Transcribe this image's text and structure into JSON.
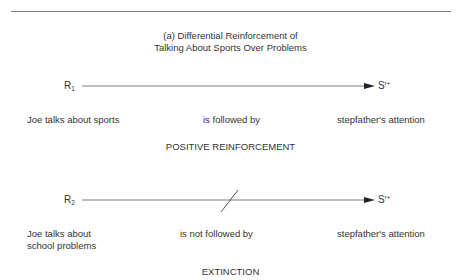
{
  "title": {
    "line1": "(a) Differential Reinforcement of",
    "line2": "Talking About Sports Over Problems"
  },
  "panels": [
    {
      "response_symbol": "R",
      "response_subscript": "1",
      "consequence_symbol": "S",
      "consequence_superscript": "r+",
      "arrow_blocked": false,
      "response_label": "Joe talks about sports",
      "relation_label": "is followed by",
      "consequence_label": "stepfather's attention",
      "procedure": "POSITIVE REINFORCEMENT"
    },
    {
      "response_symbol": "R",
      "response_subscript": "2",
      "consequence_symbol": "S",
      "consequence_superscript": "r+",
      "arrow_blocked": true,
      "response_label_line1": "Joe talks about",
      "response_label_line2": "school problems",
      "relation_label": "is not followed by",
      "consequence_label": "stepfather's attention",
      "procedure": "EXTINCTION"
    }
  ],
  "colors": {
    "line": "#7a7a7a",
    "text": "#333333",
    "arrowhead": "#222222"
  }
}
